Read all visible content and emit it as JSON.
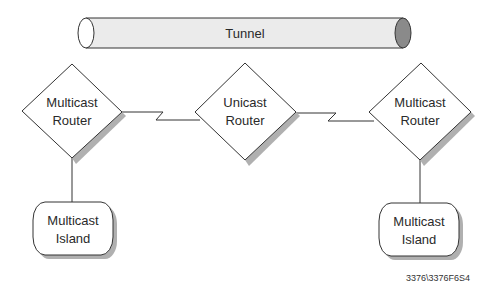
{
  "diagram": {
    "tunnel": {
      "label": "Tunnel",
      "body_color": "#ebebeb",
      "end_color": "#8a8a8a"
    },
    "routers": [
      {
        "id": "left",
        "type": "multicast",
        "label_line1": "Multicast",
        "label_line2": "Router"
      },
      {
        "id": "center",
        "type": "unicast",
        "label_line1": "Unicast",
        "label_line2": "Router"
      },
      {
        "id": "right",
        "type": "multicast",
        "label_line1": "Multicast",
        "label_line2": "Router"
      }
    ],
    "islands": [
      {
        "id": "left",
        "label_line1": "Multicast",
        "label_line2": "Island"
      },
      {
        "id": "right",
        "label_line1": "Multicast",
        "label_line2": "Island"
      }
    ],
    "connections": [
      {
        "from": "left-router",
        "to": "center-router",
        "style": "serial-link"
      },
      {
        "from": "center-router",
        "to": "right-router",
        "style": "serial-link"
      },
      {
        "from": "left-router",
        "to": "left-island",
        "style": "line"
      },
      {
        "from": "right-router",
        "to": "right-island",
        "style": "line"
      }
    ],
    "shadow_color": "#b0b0b0",
    "stroke_color": "#333333",
    "figure_id": "3376\\3376F6S4"
  }
}
